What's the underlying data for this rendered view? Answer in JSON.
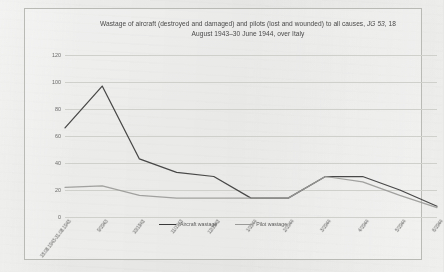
{
  "chart_data": {
    "type": "line",
    "title": "Wastage of aircraft (destroyed and damaged) and pilots (lost and wounded) to all causes, JG 53, 18 August 1943–30 June 1944, over Italy",
    "title_line1_pre": "Wastage of aircraft (destroyed and damaged) and pilots (lost and wounded) to all causes, ",
    "title_line1_italic": "JG 53",
    "title_line1_post": ", 18",
    "title_line2": "August 1943–30 June 1944, over Italy",
    "xlabel": "",
    "ylabel": "",
    "ylim": [
      0,
      120
    ],
    "yticks": [
      0,
      20,
      40,
      60,
      80,
      100,
      120
    ],
    "grid": true,
    "legend_position": "bottom",
    "categories": [
      "18.08.1943-31.08.1943",
      "9/1943",
      "10/1943",
      "11/1943",
      "12/1943",
      "1/1944",
      "2/1944",
      "3/1944",
      "4/1944",
      "5/1944",
      "6/1944"
    ],
    "series": [
      {
        "name": "Aircraft wastage",
        "color": "#3a3a3a",
        "values": [
          66,
          97,
          43,
          33,
          30,
          14,
          14,
          30,
          30,
          20,
          8
        ]
      },
      {
        "name": "Pilot wastage",
        "color": "#9a9a98",
        "values": [
          22,
          23,
          16,
          14,
          14,
          14,
          14,
          30,
          26,
          16,
          7
        ]
      }
    ]
  },
  "legend": {
    "items": [
      {
        "label": "Aircraft wastage",
        "color": "#3a3a3a"
      },
      {
        "label": "Pilot wastage",
        "color": "#9a9a98"
      }
    ]
  },
  "colors": {
    "border": "#b9b9b6",
    "grid": "#cfcfcc",
    "background": "#e8e8e6",
    "text": "#4a4a4a"
  }
}
